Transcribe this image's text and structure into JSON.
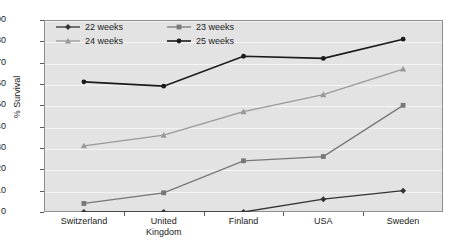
{
  "chart_data": {
    "type": "line",
    "title": "",
    "xlabel": "",
    "ylabel": "% Survival",
    "categories": [
      "Switzerland",
      "United\nKingdom",
      "Finland",
      "USA",
      "Sweden"
    ],
    "ylim": [
      0,
      90
    ],
    "yticks": [
      0,
      10,
      20,
      30,
      40,
      50,
      60,
      70,
      80,
      90
    ],
    "grid": true,
    "legend_position": "top-left",
    "series": [
      {
        "name": "22 weeks",
        "values": [
          0,
          0,
          0,
          6,
          10
        ],
        "color": "#333333",
        "marker": "diamond"
      },
      {
        "name": "23 weeks",
        "values": [
          4,
          9,
          24,
          26,
          50
        ],
        "color": "#777777",
        "marker": "square"
      },
      {
        "name": "24 weeks",
        "values": [
          31,
          36,
          47,
          55,
          67
        ],
        "color": "#999999",
        "marker": "triangle"
      },
      {
        "name": "25 weeks",
        "values": [
          61,
          59,
          73,
          72,
          81
        ],
        "color": "#1a1a1a",
        "marker": "circle"
      }
    ]
  },
  "axis": {
    "y_label": "% Survival",
    "y_tick_labels": [
      "0",
      "10",
      "20",
      "30",
      "40",
      "50",
      "60",
      "70",
      "80",
      "90"
    ],
    "x_tick_labels": [
      "Switzerland",
      "United\nKingdom",
      "Finland",
      "USA",
      "Sweden"
    ]
  },
  "legend": {
    "entries": [
      {
        "label": "22 weeks"
      },
      {
        "label": "23 weeks"
      },
      {
        "label": "24 weeks"
      },
      {
        "label": "25 weeks"
      }
    ]
  },
  "colors": {
    "plot_background": "#e3e3e3",
    "gridline": "#f4f4f4",
    "frame": "#8e8e8e",
    "series_22": "#333333",
    "series_23": "#777777",
    "series_24": "#999999",
    "series_25": "#1a1a1a"
  }
}
